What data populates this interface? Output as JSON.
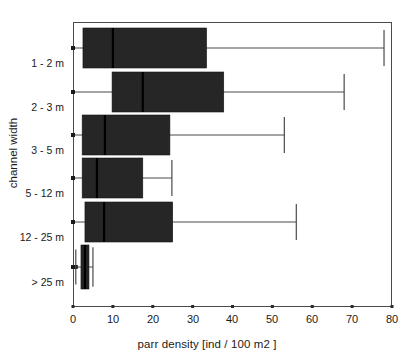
{
  "chart_data": {
    "type": "box",
    "title": "",
    "xlabel": "parr density [ind / 100 m2 ]",
    "ylabel": "channel width",
    "orientation": "horizontal",
    "xlim": [
      0,
      80
    ],
    "xticks": [
      0,
      10,
      20,
      30,
      40,
      50,
      60,
      70,
      80
    ],
    "xtick_labels": [
      "0",
      "10",
      "20",
      "30",
      "40",
      "50",
      "60",
      "70",
      "80"
    ],
    "grid": false,
    "legend": null,
    "categories": [
      "1 - 2 m",
      "2 - 3 m",
      "3 - 5 m",
      "5 - 12 m",
      "12 - 25 m",
      "> 25 m"
    ],
    "box_color": "#262626",
    "line_color": "#4a4a4a",
    "boxes": [
      {
        "category": "1 - 2 m",
        "whisker_low": 0.0,
        "q1": 2.5,
        "median": 10.0,
        "q3": 33.5,
        "whisker_high": 78.0
      },
      {
        "category": "2 - 3 m",
        "whisker_low": 0.0,
        "q1": 9.8,
        "median": 17.5,
        "q3": 37.8,
        "whisker_high": 68.0
      },
      {
        "category": "3 - 5 m",
        "whisker_low": 0.0,
        "q1": 2.3,
        "median": 8.0,
        "q3": 24.3,
        "whisker_high": 53.0
      },
      {
        "category": "5 - 12 m",
        "whisker_low": 0.0,
        "q1": 2.3,
        "median": 6.0,
        "q3": 17.5,
        "whisker_high": 24.8
      },
      {
        "category": "12 - 25 m",
        "whisker_low": 0.0,
        "q1": 3.0,
        "median": 7.8,
        "q3": 25.0,
        "whisker_high": 56.0
      },
      {
        "category": "> 25 m",
        "whisker_low": 0.7,
        "q1": 2.0,
        "median": 3.0,
        "q3": 4.0,
        "whisker_high": 5.0
      }
    ]
  }
}
